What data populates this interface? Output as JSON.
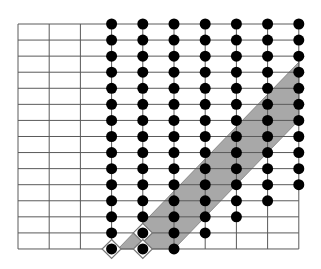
{
  "diagram": {
    "title": "",
    "grid": {
      "left": 18,
      "top": 24,
      "col_step": 31.2,
      "row_step": 16.07,
      "cols": 9,
      "rows": 14,
      "line_color": "#5a5a5a"
    },
    "dot_columns": [
      {
        "col": 3,
        "from_row": 0,
        "to_row": 14
      },
      {
        "col": 4,
        "from_row": 0,
        "to_row": 14
      },
      {
        "col": 5,
        "from_row": 0,
        "to_row": 14
      },
      {
        "col": 6,
        "from_row": 0,
        "to_row": 13
      },
      {
        "col": 7,
        "from_row": 0,
        "to_row": 12
      },
      {
        "col": 8,
        "from_row": 0,
        "to_row": 11
      },
      {
        "col": 9,
        "from_row": 0,
        "to_row": 10
      }
    ],
    "dot_color": "#000000",
    "dot_radius": 5.5,
    "diamonds": [
      {
        "col": 3,
        "row": 14
      },
      {
        "col": 4,
        "row": 13
      },
      {
        "col": 4,
        "row": 14
      }
    ],
    "shaded_region": {
      "points": [
        [
          118,
          249
        ],
        [
          174,
          249
        ],
        [
          299,
          120
        ],
        [
          299,
          62
        ]
      ],
      "fill": "#a8a8a8",
      "stroke": "#8a8a8a"
    }
  }
}
